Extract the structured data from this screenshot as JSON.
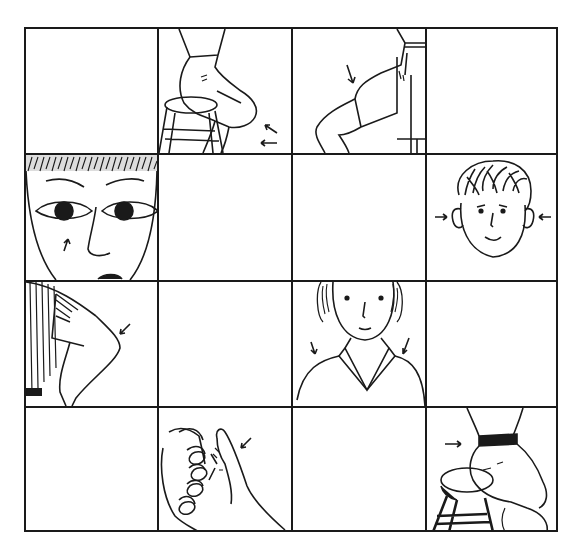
{
  "figure": {
    "type": "body-part-illustration-grid",
    "rows": 4,
    "cols": 4,
    "line_color": "#1a1a1a",
    "background": "#ffffff",
    "cells": [
      {
        "row": 0,
        "col": 0,
        "content": "empty",
        "label": ""
      },
      {
        "row": 0,
        "col": 1,
        "content": "person-sitting-on-stool-side-view",
        "arrows": 3,
        "label": ""
      },
      {
        "row": 0,
        "col": 2,
        "content": "thigh-and-knee-side-view",
        "arrows": 1,
        "label": ""
      },
      {
        "row": 0,
        "col": 3,
        "content": "empty",
        "label": ""
      },
      {
        "row": 1,
        "col": 0,
        "content": "face-close-up-eyes-nose",
        "arrows": 2,
        "label": ""
      },
      {
        "row": 1,
        "col": 1,
        "content": "empty",
        "label": ""
      },
      {
        "row": 1,
        "col": 2,
        "content": "empty",
        "label": ""
      },
      {
        "row": 1,
        "col": 3,
        "content": "boy-head-ears",
        "arrows": 2,
        "label": ""
      },
      {
        "row": 2,
        "col": 0,
        "content": "bent-arm-elbow",
        "arrows": 1,
        "label": ""
      },
      {
        "row": 2,
        "col": 1,
        "content": "empty",
        "label": ""
      },
      {
        "row": 2,
        "col": 2,
        "content": "person-shoulders-collar",
        "arrows": 2,
        "label": ""
      },
      {
        "row": 2,
        "col": 3,
        "content": "empty",
        "label": ""
      },
      {
        "row": 3,
        "col": 0,
        "content": "empty",
        "label": ""
      },
      {
        "row": 3,
        "col": 1,
        "content": "hand-thumb",
        "arrows": 1,
        "label": ""
      },
      {
        "row": 3,
        "col": 2,
        "content": "empty",
        "label": ""
      },
      {
        "row": 3,
        "col": 3,
        "content": "person-sitting-on-stool-waist",
        "arrows": 1,
        "label": ""
      }
    ]
  }
}
